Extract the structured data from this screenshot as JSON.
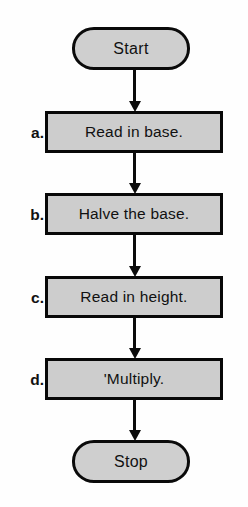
{
  "figure": {
    "type": "flowchart",
    "orientation": "vertical",
    "background_color": "#ffffff",
    "node_fill_color": "#cdcdcd",
    "node_border_color": "#0a0a0a",
    "text_color": "#111111"
  },
  "nodes": {
    "start": {
      "label": "Start",
      "shape": "terminator"
    },
    "stop": {
      "label": "Stop",
      "shape": "terminator"
    },
    "steps": [
      {
        "key": "a",
        "marker": "a.",
        "label": "Read in base.",
        "shape": "process"
      },
      {
        "key": "b",
        "marker": "b.",
        "label": "Halve the base.",
        "shape": "process"
      },
      {
        "key": "c",
        "marker": "c.",
        "label": "Read in height.",
        "shape": "process"
      },
      {
        "key": "d",
        "marker": "d.",
        "label": "'Multiply.",
        "shape": "process"
      }
    ]
  },
  "connectors": [
    {
      "from": "start",
      "to": "a",
      "style": "arrow-down"
    },
    {
      "from": "a",
      "to": "b",
      "style": "arrow-down"
    },
    {
      "from": "b",
      "to": "c",
      "style": "arrow-down"
    },
    {
      "from": "c",
      "to": "d",
      "style": "arrow-down"
    },
    {
      "from": "d",
      "to": "stop",
      "style": "arrow-down"
    }
  ]
}
